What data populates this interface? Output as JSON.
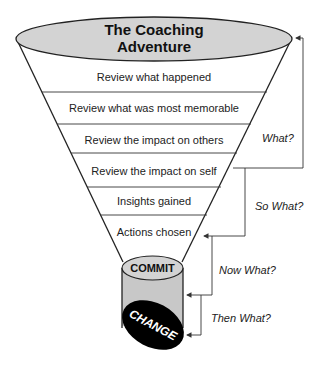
{
  "title": {
    "line1": "The Coaching",
    "line2": "Adventure"
  },
  "stages": [
    {
      "label": "Review what happened"
    },
    {
      "label": "Review what was most memorable"
    },
    {
      "label": "Review the impact on others"
    },
    {
      "label": "Review the impact on self"
    },
    {
      "label": "Insights gained"
    },
    {
      "label": "Actions chosen"
    }
  ],
  "cylinder": {
    "top_label": "COMMIT",
    "bottom_label": "CHANGE"
  },
  "questions": [
    {
      "label": "What?"
    },
    {
      "label": "So What?"
    },
    {
      "label": "Now What?"
    },
    {
      "label": "Then What?"
    }
  ],
  "colors": {
    "ellipse_fill": "#d3d3d3",
    "cylinder_fill": "#c8c8c8",
    "change_fill": "#000000",
    "stroke": "#222222"
  }
}
